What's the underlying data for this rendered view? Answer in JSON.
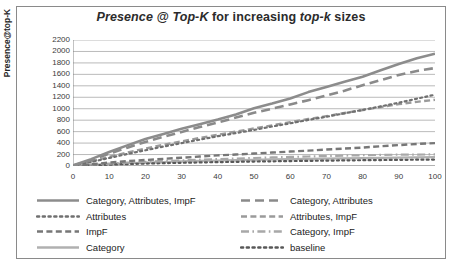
{
  "chart_data": {
    "type": "line",
    "title": "Presence @ Top-K for increasing top-k sizes",
    "title_parts": [
      {
        "text": "Presence @ Top-K",
        "style": "italic"
      },
      {
        "text": " for increasing ",
        "style": "upright"
      },
      {
        "text": "top-k",
        "style": "italic"
      },
      {
        "text": " sizes",
        "style": "upright"
      }
    ],
    "xlabel": "",
    "ylabel": "Presence@top-K",
    "xlim": [
      0,
      100
    ],
    "ylim": [
      0,
      2200
    ],
    "ytick_step": 200,
    "xtick_step": 10,
    "grid": "horizontal",
    "legend_position": "bottom",
    "xticks": [
      "0",
      "10",
      "20",
      "30",
      "40",
      "50",
      "60",
      "70",
      "80",
      "90",
      "100"
    ],
    "yticks": [
      "0",
      "200",
      "400",
      "600",
      "800",
      "1000",
      "1200",
      "1400",
      "1600",
      "1800",
      "2000",
      "2200"
    ],
    "x": [
      0,
      5,
      10,
      15,
      20,
      25,
      30,
      35,
      40,
      45,
      50,
      55,
      60,
      65,
      70,
      75,
      80,
      85,
      90,
      95,
      100
    ],
    "series": [
      {
        "name": "Category, Attributes, ImpF",
        "style": "solid",
        "color": "#8c8c8c",
        "width": 2.6,
        "values": [
          10,
          120,
          245,
          360,
          470,
          560,
          650,
          730,
          810,
          900,
          1010,
          1090,
          1180,
          1290,
          1380,
          1470,
          1560,
          1670,
          1780,
          1880,
          1960
        ]
      },
      {
        "name": "Category, Attributes",
        "style": "long-dash",
        "color": "#8a8a8a",
        "width": 2.6,
        "values": [
          8,
          100,
          215,
          320,
          420,
          510,
          595,
          680,
          760,
          845,
          930,
          1000,
          1075,
          1150,
          1230,
          1315,
          1410,
          1500,
          1590,
          1660,
          1710
        ]
      },
      {
        "name": "Attributes",
        "style": "dotted",
        "color": "#707070",
        "width": 2.2,
        "values": [
          6,
          70,
          140,
          210,
          275,
          340,
          400,
          460,
          520,
          575,
          630,
          690,
          745,
          805,
          860,
          920,
          980,
          1040,
          1105,
          1175,
          1245
        ]
      },
      {
        "name": "Attributes, ImpF",
        "style": "dash",
        "color": "#9a9a9a",
        "width": 2.4,
        "values": [
          6,
          80,
          160,
          235,
          305,
          370,
          430,
          490,
          545,
          600,
          655,
          710,
          765,
          820,
          870,
          925,
          975,
          1030,
          1080,
          1120,
          1155
        ]
      },
      {
        "name": "ImpF",
        "style": "dash",
        "color": "#777777",
        "width": 2.4,
        "values": [
          4,
          30,
          60,
          85,
          105,
          125,
          145,
          165,
          185,
          200,
          218,
          235,
          252,
          268,
          288,
          305,
          322,
          345,
          365,
          385,
          400
        ]
      },
      {
        "name": "Category, ImpF",
        "style": "dash-dot",
        "color": "#a8a8a8",
        "width": 2.2,
        "values": [
          3,
          22,
          42,
          58,
          72,
          86,
          98,
          110,
          120,
          130,
          140,
          150,
          158,
          166,
          174,
          182,
          188,
          194,
          198,
          200,
          202
        ]
      },
      {
        "name": "Category",
        "style": "solid",
        "color": "#b0b0b0",
        "width": 2.2,
        "values": [
          2,
          18,
          34,
          48,
          60,
          70,
          80,
          88,
          96,
          102,
          108,
          114,
          120,
          125,
          130,
          134,
          138,
          142,
          146,
          150,
          154
        ]
      },
      {
        "name": "baseline",
        "style": "dotted",
        "color": "#585858",
        "width": 2.2,
        "values": [
          1,
          12,
          24,
          34,
          42,
          50,
          56,
          62,
          68,
          73,
          78,
          82,
          86,
          90,
          94,
          98,
          101,
          104,
          107,
          110,
          112
        ]
      }
    ]
  },
  "legend": {
    "left_column": [
      {
        "label": "Category, Attributes, ImpF",
        "series_index": 0
      },
      {
        "label": "Attributes",
        "series_index": 2
      },
      {
        "label": "ImpF",
        "series_index": 4
      },
      {
        "label": "Category",
        "series_index": 6
      }
    ],
    "right_column": [
      {
        "label": "Category, Attributes",
        "series_index": 1
      },
      {
        "label": "Attributes, ImpF",
        "series_index": 3
      },
      {
        "label": "Category, ImpF",
        "series_index": 5
      },
      {
        "label": "baseline",
        "series_index": 7
      }
    ]
  },
  "colors": {
    "grid": "#9c9c9c",
    "axis": "#7a7a7a",
    "text": "#2b2b2b",
    "border": "#8a8a8a",
    "background": "#ffffff"
  }
}
